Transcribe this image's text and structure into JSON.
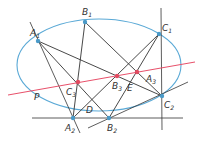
{
  "colors": {
    "conic": "#5aa9d6",
    "pascal_line": "#e8506a",
    "lines": "#333333",
    "point_blue": "#4a9ac8",
    "point_red": "#e04a60"
  },
  "conic": {
    "cx": 99,
    "cy": 65,
    "rx": 82,
    "ry": 46
  },
  "points": {
    "A1": {
      "x": 38,
      "y": 41,
      "label": "A",
      "sub": "1",
      "lx": 30,
      "ly": 36
    },
    "B1": {
      "x": 85,
      "y": 22,
      "label": "B",
      "sub": "1",
      "lx": 82,
      "ly": 15
    },
    "C1": {
      "x": 159,
      "y": 34,
      "label": "C",
      "sub": "1",
      "lx": 162,
      "ly": 31
    },
    "A2": {
      "x": 73,
      "y": 118,
      "label": "A",
      "sub": "2",
      "lx": 65,
      "ly": 131
    },
    "B2": {
      "x": 109,
      "y": 118,
      "label": "B",
      "sub": "2",
      "lx": 107,
      "ly": 131
    },
    "C2": {
      "x": 162,
      "y": 96,
      "label": "C",
      "sub": "2",
      "lx": 164,
      "ly": 108
    },
    "A3": {
      "x": 137,
      "y": 72,
      "label": "A",
      "sub": "3",
      "lx": 146,
      "ly": 82
    },
    "B3": {
      "x": 117,
      "y": 76,
      "label": "B",
      "sub": "3",
      "lx": 112,
      "ly": 89
    },
    "C3": {
      "x": 78,
      "y": 82,
      "label": "C",
      "sub": "3",
      "lx": 66,
      "ly": 95
    }
  },
  "labels": {
    "P": {
      "text": "P",
      "x": 34,
      "y": 100
    },
    "D": {
      "text": "D",
      "x": 86,
      "y": 113
    },
    "E": {
      "text": "E",
      "x": 127,
      "y": 91
    }
  },
  "segments": [
    [
      "A1",
      "B2"
    ],
    [
      "A1",
      "C2"
    ],
    [
      "B1",
      "A2"
    ],
    [
      "B1",
      "C2"
    ],
    [
      "C1",
      "A2"
    ],
    [
      "C1",
      "B2"
    ]
  ],
  "extended_lines": [
    {
      "name": "line-A1-A2",
      "x1": 30,
      "y1": 22,
      "x2": 80,
      "y2": 133
    },
    {
      "name": "line-A2-B2-bottom",
      "x1": 32,
      "y1": 118,
      "x2": 183,
      "y2": 118
    },
    {
      "name": "line-C1-C2-vertical",
      "x1": 161,
      "y1": 8,
      "x2": 162,
      "y2": 130
    },
    {
      "name": "line-B2-C2",
      "x1": 88,
      "y1": 128,
      "x2": 188,
      "y2": 82
    }
  ],
  "pascal_line": {
    "x1": 8,
    "y1": 95,
    "x2": 195,
    "y2": 62,
    "label": "P"
  }
}
